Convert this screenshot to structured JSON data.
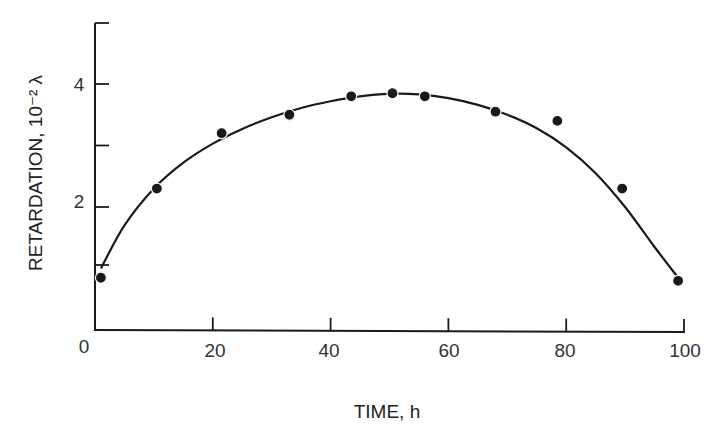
{
  "chart_data": {
    "type": "scatter",
    "title": "",
    "xlabel": "TIME, h",
    "ylabel": "RETARDATION, 10⁻² λ",
    "xlim": [
      0,
      100
    ],
    "ylim": [
      0,
      5
    ],
    "x_ticks": [
      0,
      20,
      40,
      60,
      80,
      100
    ],
    "x_tick_labels": [
      "0",
      "20",
      "40",
      "60",
      "80",
      "100"
    ],
    "y_ticks": [
      1,
      2,
      3,
      4,
      5
    ],
    "y_tick_labels": [
      "2",
      "4"
    ],
    "y_labeled_ticks": [
      2,
      4
    ],
    "grid": false,
    "legend": null,
    "series": [
      {
        "name": "measured retardation",
        "style": "markers",
        "color": "#1a1a1a",
        "x": [
          1,
          10.5,
          21.5,
          33,
          43.5,
          50.5,
          56,
          68,
          78.5,
          89.5,
          99
        ],
        "y": [
          0.85,
          2.3,
          3.2,
          3.5,
          3.8,
          3.85,
          3.8,
          3.55,
          3.4,
          2.3,
          0.8
        ]
      },
      {
        "name": "fitted curve",
        "style": "line",
        "color": "#1a1a1a",
        "x": [
          1,
          5,
          10,
          15,
          20,
          25,
          30,
          35,
          40,
          45,
          50,
          55,
          60,
          65,
          70,
          75,
          80,
          85,
          90,
          95,
          99
        ],
        "y": [
          1.0,
          1.7,
          2.3,
          2.72,
          3.03,
          3.27,
          3.46,
          3.61,
          3.72,
          3.8,
          3.84,
          3.83,
          3.77,
          3.66,
          3.5,
          3.28,
          2.97,
          2.55,
          2.0,
          1.35,
          0.85
        ]
      }
    ]
  },
  "axes": {
    "x_title": "TIME, h",
    "y_title": "RETARDATION, 10⁻² λ",
    "origin_label": "0",
    "x_labels": [
      "20",
      "40",
      "60",
      "80",
      "100"
    ],
    "y_labels": [
      "2",
      "4"
    ]
  }
}
